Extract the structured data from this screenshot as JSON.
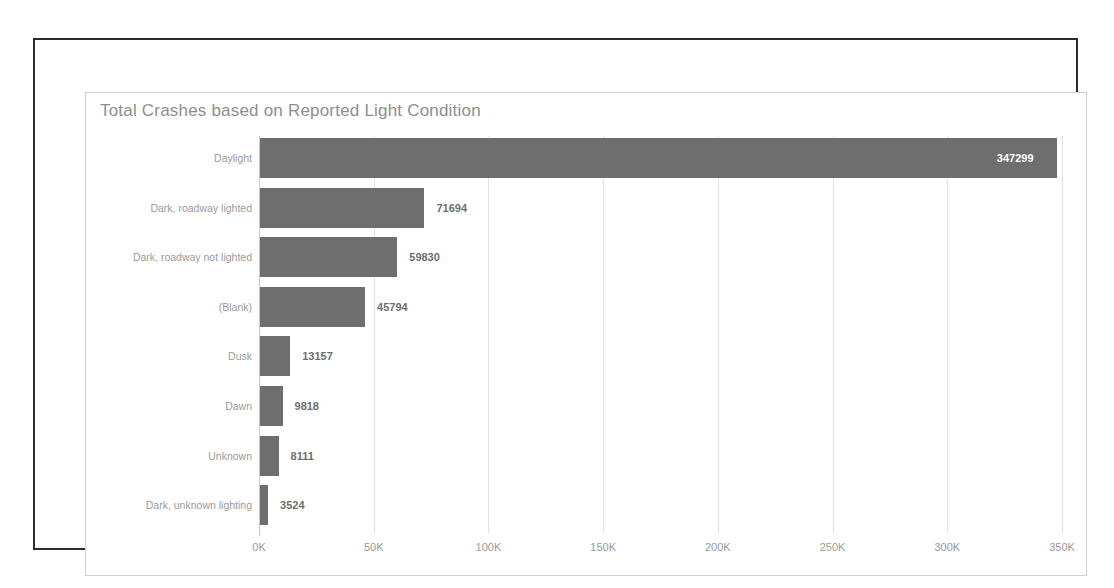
{
  "chart_data": {
    "type": "bar",
    "orientation": "horizontal",
    "title": "Total Crashes based on Reported Light Condition",
    "xlabel": "",
    "ylabel": "",
    "grid": true,
    "legend": false,
    "xlim": [
      0,
      350000
    ],
    "xticks": [
      0,
      50000,
      100000,
      150000,
      200000,
      250000,
      300000,
      350000
    ],
    "xtick_labels": [
      "0K",
      "50K",
      "100K",
      "150K",
      "200K",
      "250K",
      "300K",
      "350K"
    ],
    "categories": [
      "Daylight",
      "Dark, roadway lighted",
      "Dark, roadway not lighted",
      "(Blank)",
      "Dusk",
      "Dawn",
      "Unknown",
      "Dark, unknown lighting"
    ],
    "values": [
      347299,
      71694,
      59830,
      45794,
      13157,
      9818,
      8111,
      3524
    ],
    "value_labels": [
      "347299",
      "71694",
      "59830",
      "45794",
      "13157",
      "9818",
      "8111",
      "3524"
    ],
    "bar_color": "#6e6e6e",
    "label_color": "#9a9a9a",
    "title_color": "#8e8e8e",
    "grid_color": "#e2e2e2"
  },
  "frame": {
    "outer_border_color": "#2b2b2b",
    "card_border_color": "#cfcfcf",
    "background": "#ffffff"
  }
}
